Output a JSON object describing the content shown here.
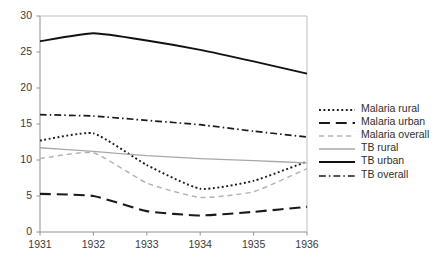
{
  "chart_data": {
    "type": "line",
    "title": "",
    "subtitle": "",
    "xlabel": "",
    "ylabel": "",
    "x": [
      "1931",
      "1932",
      "1933",
      "1934",
      "1935",
      "1936"
    ],
    "categories": [
      "1931",
      "1932",
      "1933",
      "1934",
      "1935",
      "1936"
    ],
    "xlim": [
      1931,
      1936
    ],
    "ylim": [
      0,
      30
    ],
    "yticks": [
      "0",
      "5",
      "10",
      "15",
      "20",
      "25",
      "30"
    ],
    "ytick_values": [
      0,
      5,
      10,
      15,
      20,
      25,
      30
    ],
    "grid": false,
    "legend_position": "right",
    "series": [
      {
        "name": "Malaria rural",
        "values": [
          12.7,
          13.7,
          9.3,
          6.0,
          7.1,
          9.8
        ],
        "style": "dotted",
        "color": "#1a1a1a",
        "width": 1.9
      },
      {
        "name": "Malaria urban",
        "values": [
          5.3,
          5.0,
          2.9,
          2.3,
          2.8,
          3.5
        ],
        "style": "long-dash",
        "color": "#1a1a1a",
        "width": 2.1
      },
      {
        "name": "Malaria overall",
        "values": [
          10.2,
          11.0,
          6.8,
          4.8,
          5.6,
          8.8
        ],
        "style": "dashed",
        "color": "#b4b4b4",
        "width": 1.5
      },
      {
        "name": "TB rural",
        "values": [
          11.7,
          11.2,
          10.6,
          10.2,
          9.9,
          9.6
        ],
        "style": "solid",
        "color": "#a9a9a9",
        "width": 1.3
      },
      {
        "name": "TB urban",
        "values": [
          26.5,
          27.6,
          26.6,
          25.3,
          23.7,
          22.0
        ],
        "style": "solid",
        "color": "#111111",
        "width": 1.9
      },
      {
        "name": "TB overall",
        "values": [
          16.3,
          16.1,
          15.5,
          14.9,
          14.0,
          13.2
        ],
        "style": "dash-dot",
        "color": "#1a1a1a",
        "width": 1.7
      }
    ],
    "legend": [
      "Malaria rural",
      "Malaria urban",
      "Malaria overall",
      "TB rural",
      "TB urban",
      "TB overall"
    ],
    "axis_color": "#808080",
    "background": "#ffffff"
  }
}
